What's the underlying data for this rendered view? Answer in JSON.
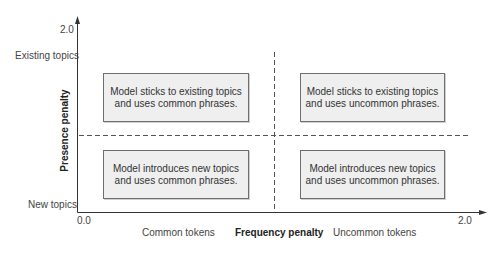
{
  "diagram": {
    "type": "quadrant",
    "y_axis": {
      "title": "Presence penalty",
      "max_tick": "2.0",
      "top_category": "Existing topics",
      "bottom_category": "New topics"
    },
    "x_axis": {
      "title": "Frequency penalty",
      "origin_tick": "0.0",
      "max_tick": "2.0",
      "left_category": "Common tokens",
      "right_category": "Uncommon tokens"
    },
    "quadrants": {
      "top_left": {
        "line1": "Model sticks to existing topics",
        "line2": "and uses common phrases."
      },
      "top_right": {
        "line1": "Model sticks to existing topics",
        "line2": "and uses uncommon phrases."
      },
      "bottom_left": {
        "line1": "Model introduces new topics",
        "line2": "and uses common phrases."
      },
      "bottom_right": {
        "line1": "Model introduces new topics",
        "line2": "and uses uncommon phrases."
      }
    },
    "colors": {
      "axis": "#333333",
      "dashed_divider": "#555555",
      "box_fill": "#efefef",
      "box_border": "#6e6e6e"
    }
  }
}
